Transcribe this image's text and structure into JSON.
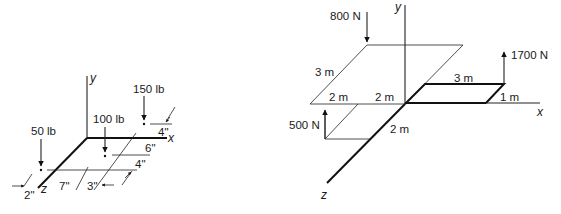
{
  "figure_left": {
    "axes": {
      "x": "x",
      "y": "y",
      "z": "z"
    },
    "loads": [
      {
        "label": "50 lb"
      },
      {
        "label": "100 lb"
      },
      {
        "label": "150 lb"
      }
    ],
    "dimensions": {
      "d_2in": "2\"",
      "d_7in": "7\"",
      "d_3in": "3\"",
      "d_4in_lower": "4\"",
      "d_6in": "6\"",
      "d_4in_upper": "4\""
    }
  },
  "figure_right": {
    "axes": {
      "x": "x",
      "y": "y",
      "z": "z"
    },
    "loads": [
      {
        "label": "800 N",
        "direction": "down"
      },
      {
        "label": "500 N",
        "direction": "up"
      },
      {
        "label": "1700 N",
        "direction": "up"
      }
    ],
    "dimensions": {
      "d_3m_left": "3 m",
      "d_2m_a": "2 m",
      "d_2m_b": "2 m",
      "d_2m_z": "2 m",
      "d_3m_right": "3 m",
      "d_1m": "1 m"
    }
  }
}
